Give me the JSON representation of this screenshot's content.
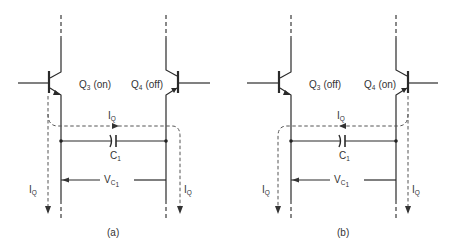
{
  "figure": {
    "panels": [
      {
        "id": "a",
        "caption": "(a)",
        "left_transistor": {
          "name": "Q",
          "sub": "3",
          "state": "(on)"
        },
        "right_transistor": {
          "name": "Q",
          "sub": "4",
          "state": "(off)"
        },
        "current_label": {
          "name": "I",
          "sub": "Q"
        },
        "left_current_label": {
          "name": "I",
          "sub": "Q"
        },
        "right_current_label": {
          "name": "I",
          "sub": "Q"
        },
        "capacitor_label": {
          "name": "C",
          "sub": "1"
        },
        "voltage_label": {
          "name": "V",
          "sub": "C",
          "subsub": "1"
        },
        "current_direction": "left-to-right"
      },
      {
        "id": "b",
        "caption": "(b)",
        "left_transistor": {
          "name": "Q",
          "sub": "3",
          "state": "(off)"
        },
        "right_transistor": {
          "name": "Q",
          "sub": "4",
          "state": "(on)"
        },
        "current_label": {
          "name": "I",
          "sub": "Q"
        },
        "left_current_label": {
          "name": "I",
          "sub": "Q"
        },
        "right_current_label": {
          "name": "I",
          "sub": "Q"
        },
        "capacitor_label": {
          "name": "C",
          "sub": "1"
        },
        "voltage_label": {
          "name": "V",
          "sub": "C",
          "subsub": "1"
        },
        "current_direction": "right-to-left"
      }
    ]
  }
}
